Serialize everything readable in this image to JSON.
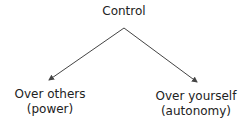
{
  "diagram": {
    "type": "tree",
    "root": {
      "label": "Control"
    },
    "children": [
      {
        "line1": "Over others",
        "line2": "(power)"
      },
      {
        "line1": "Over yourself",
        "line2": "(autonomy)"
      }
    ],
    "edge_color": "#444444"
  }
}
